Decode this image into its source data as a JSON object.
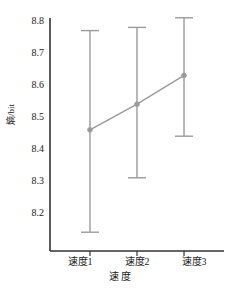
{
  "chart_data": {
    "type": "line",
    "title": "",
    "subtitle": "",
    "xlabel": "速 度",
    "ylabel": "熵/bit",
    "categories": [
      "速度1",
      "速度2",
      "速度3"
    ],
    "values": [
      8.46,
      8.54,
      8.63
    ],
    "error_low": [
      8.14,
      8.31,
      8.44
    ],
    "error_high": [
      8.77,
      8.78,
      8.81
    ],
    "series": [
      {
        "name": "熵/bit",
        "values": [
          8.46,
          8.54,
          8.63
        ],
        "error_low": [
          8.14,
          8.31,
          8.44
        ],
        "error_high": [
          8.77,
          8.78,
          8.81
        ]
      }
    ],
    "ylim": [
      8.13,
      8.83
    ],
    "yticks": [
      8.2,
      8.3,
      8.4,
      8.5,
      8.6,
      8.7,
      8.8
    ],
    "ytick_labels": [
      "8.2",
      "8.3",
      "8.4",
      "8.5",
      "8.6",
      "8.7",
      "8.8"
    ],
    "xlim": [
      0.5,
      3.5
    ],
    "grid": false,
    "legend": false,
    "legend_position": "none",
    "marker": "circle",
    "error_bar_style": "capped",
    "annotations": []
  },
  "style": {
    "series_color": "#9a9a9a",
    "axis_color": "#333333",
    "text_color": "#1a1a1a",
    "background": "#ffffff"
  }
}
